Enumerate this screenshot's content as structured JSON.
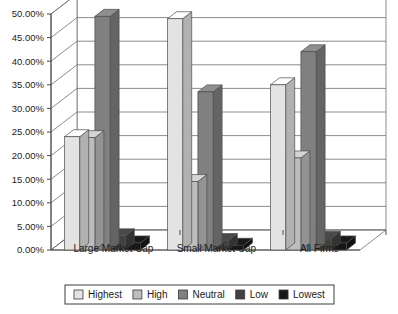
{
  "chart_data": {
    "type": "bar",
    "title": "",
    "subtitle": "",
    "xlabel": "",
    "ylabel": "",
    "categories": [
      "Large Market Cap",
      "Small Market Cap",
      "All Firms"
    ],
    "series": [
      {
        "name": "Highest",
        "values": [
          24.0,
          49.0,
          35.0
        ],
        "color": "#e3e3e3"
      },
      {
        "name": "High",
        "values": [
          23.8,
          14.5,
          19.5
        ],
        "color": "#bdbdbd"
      },
      {
        "name": "Neutral",
        "values": [
          49.5,
          33.5,
          42.0
        ],
        "color": "#808080"
      },
      {
        "name": "Low",
        "values": [
          3.0,
          2.0,
          2.5
        ],
        "color": "#414141"
      },
      {
        "name": "Lowest",
        "values": [
          1.5,
          1.0,
          1.5
        ],
        "color": "#171717"
      }
    ],
    "ylim": [
      0,
      50
    ],
    "ytick_values": [
      0,
      5,
      10,
      15,
      20,
      25,
      30,
      35,
      40,
      45,
      50
    ],
    "ytick_labels": [
      "0.00%",
      "5.00%",
      "10.00%",
      "15.00%",
      "20.00%",
      "25.00%",
      "30.00%",
      "35.00%",
      "40.00%",
      "45.00%",
      "50.00%"
    ],
    "value_format": "percent",
    "grid": true,
    "grid_axis": "y",
    "legend": true,
    "legend_position": "bottom",
    "legend_entries": [
      "Highest",
      "High",
      "Neutral",
      "Low",
      "Lowest"
    ],
    "three_d": true
  },
  "axis": {
    "y_ticks": [
      "50.00%",
      "45.00%",
      "40.00%",
      "35.00%",
      "30.00%",
      "25.00%",
      "20.00%",
      "15.00%",
      "10.00%",
      "5.00%",
      "0.00%"
    ]
  },
  "categories": {
    "c0": "Large Market Cap",
    "c1": "Small Market Cap",
    "c2": "All Firms"
  },
  "legend": {
    "items": [
      {
        "label": "Highest",
        "color": "#e3e3e3"
      },
      {
        "label": "High",
        "color": "#bdbdbd"
      },
      {
        "label": "Neutral",
        "color": "#808080"
      },
      {
        "label": "Low",
        "color": "#414141"
      },
      {
        "label": "Lowest",
        "color": "#171717"
      }
    ]
  },
  "colors": {
    "background": "#ffffff",
    "grid": "#6e6e6e",
    "axis": "#4a4a4a",
    "text": "#1c1c1c",
    "legend_border": "#3c3c3c"
  }
}
